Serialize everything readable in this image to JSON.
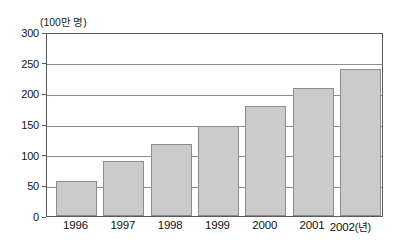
{
  "chart_data": {
    "type": "bar",
    "title": "",
    "subtitle": "",
    "unit_label": "(100만 명)",
    "xlabel": "(년)",
    "ylabel": "",
    "categories": [
      "1996",
      "1997",
      "1998",
      "1999",
      "2000",
      "2001",
      "2002"
    ],
    "values": [
      57,
      89,
      118,
      146,
      179,
      209,
      240
    ],
    "series": [
      {
        "name": "",
        "values": [
          57,
          89,
          118,
          146,
          179,
          209,
          240
        ]
      }
    ],
    "ylim": [
      0,
      300
    ],
    "y_ticks": [
      "0",
      "50",
      "100",
      "150",
      "200",
      "250",
      "300"
    ],
    "y_tick_values": [
      0,
      50,
      100,
      150,
      200,
      250,
      300
    ],
    "grid": true,
    "grid_axis": "y",
    "legend": false,
    "legend_position": "none",
    "bar_fill_color": "#cbcbcb",
    "bar_border_color": "#8d8d8d",
    "grid_color": "#8e8e8e",
    "axis_color": "#5a5a5a",
    "text_color": "#101010"
  },
  "figure": {
    "background_color": "#ffffff"
  }
}
